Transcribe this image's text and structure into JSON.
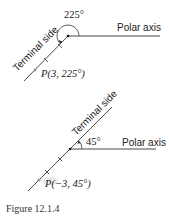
{
  "figure_top": {
    "angle_label": "225°",
    "axis_label": "Polar axis",
    "terminal_label": "Terminal side",
    "point_label": "P(3, 225°)"
  },
  "figure_bottom": {
    "angle_label": "45°",
    "axis_label": "Polar axis",
    "terminal_label": "Terminal side",
    "point_label": "P(−3, 45°)"
  },
  "caption": "Figure 12.1.4",
  "colors": {
    "line": "#333333",
    "point": "#999999"
  }
}
